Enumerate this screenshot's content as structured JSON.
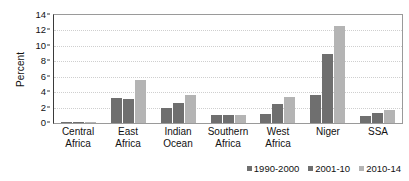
{
  "chart_data": {
    "type": "bar",
    "title": "",
    "subtitle": "",
    "xlabel": "",
    "ylabel": "Percent",
    "ylim": [
      0,
      14
    ],
    "yticks": [
      0,
      2,
      4,
      6,
      8,
      10,
      12,
      14
    ],
    "ytick_labels": [
      "0",
      "2",
      "4",
      "6",
      "8",
      "10",
      "12",
      "14"
    ],
    "grid": true,
    "grid_axis": "y",
    "legend_position": "bottom-right",
    "categories": [
      "Central Africa",
      "East Africa",
      "Indian Ocean",
      "Southern Africa",
      "West Africa",
      "Niger",
      "SSA"
    ],
    "category_lines": [
      [
        "Central",
        "Africa"
      ],
      [
        "East",
        "Africa"
      ],
      [
        "Indian",
        "Ocean"
      ],
      [
        "Southern",
        "Africa"
      ],
      [
        "West",
        "Africa"
      ],
      [
        "Niger",
        ""
      ],
      [
        "SSA",
        ""
      ]
    ],
    "series": [
      {
        "name": "1990-2000",
        "color": "#6f6f6f",
        "values": [
          0.05,
          3.3,
          2.0,
          1.0,
          1.2,
          3.6,
          0.95
        ]
      },
      {
        "name": "2001-10",
        "color": "#6f6f6f",
        "values": [
          0.05,
          3.05,
          2.6,
          1.0,
          2.45,
          9.0,
          1.25
        ]
      },
      {
        "name": "2010-14",
        "color": "#b4b4b4",
        "values": [
          0.05,
          5.6,
          3.6,
          1.1,
          3.35,
          12.6,
          1.7
        ]
      }
    ]
  },
  "legend": {
    "items": [
      {
        "label": "1990-2000",
        "color": "#6f6f6f"
      },
      {
        "label": "2001-10",
        "color": "#6f6f6f"
      },
      {
        "label": "2010-14",
        "color": "#b4b4b4"
      }
    ]
  },
  "colors": {
    "series_dark": "#6f6f6f",
    "series_light": "#b4b4b4",
    "axis": "#3a3a3a",
    "grid": "#cfcfcf",
    "text": "#111111",
    "background": "#ffffff"
  }
}
